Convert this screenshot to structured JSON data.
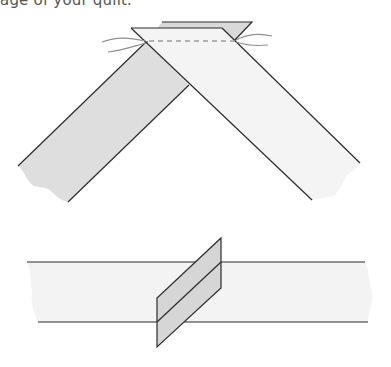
{
  "caption": "age of your quilt.",
  "figures": [
    {
      "id": "mitered-join",
      "description": "Two binding strips placed right sides together at right angles, stitched diagonally",
      "parts": [
        "left-strip",
        "right-strip",
        "back-strip-overlap",
        "stitch-line",
        "thread-tails"
      ]
    },
    {
      "id": "pressed-seam",
      "description": "Joined strip with seam allowance pressed open, shown as slanted parallelogram",
      "parts": [
        "horizontal-strip",
        "seam-flap",
        "seam-crease-line"
      ]
    }
  ],
  "colors": {
    "stroke": "#2b2b2b",
    "shaded_fill": "#dcdcdc",
    "light_fill": "#f3f3f3",
    "stitch": "#9a9a9a",
    "thread": "#8f8f8f"
  }
}
